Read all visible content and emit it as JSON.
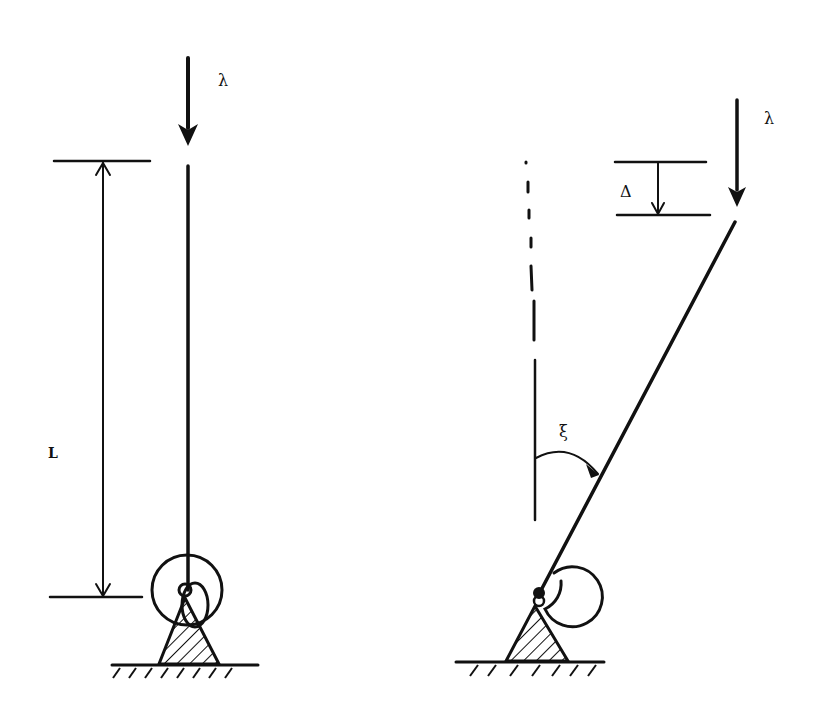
{
  "diagram": {
    "type": "inverted pendulum / buckling column with rotational spring",
    "left_figure": {
      "name": "undeformed-column",
      "load_label": "λ",
      "length_label": "L"
    },
    "right_figure": {
      "name": "deflected-column",
      "load_label": "λ",
      "deflection_label": "Δ",
      "angle_label": "ξ"
    },
    "colors": {
      "ink": "#111111",
      "background": "#ffffff"
    }
  }
}
